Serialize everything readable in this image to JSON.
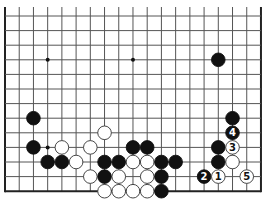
{
  "board": {
    "size": 19,
    "visible_columns": 19,
    "visible_rows": 13,
    "origin_x": 5,
    "origin_y": 16,
    "step_x": 14.22,
    "step_y": 14.6,
    "top_extends": true,
    "edges": [
      "left",
      "right",
      "bottom"
    ],
    "line_color": "#555555",
    "edge_color": "#222222",
    "star_points": [
      [
        3,
        3
      ],
      [
        9,
        3
      ],
      [
        3,
        9
      ]
    ]
  },
  "stones": [
    {
      "color": "black",
      "col": 15,
      "row": 3
    },
    {
      "color": "black",
      "col": 2,
      "row": 7
    },
    {
      "color": "black",
      "col": 16,
      "row": 7
    },
    {
      "color": "black",
      "col": 16,
      "row": 8,
      "label": "4"
    },
    {
      "color": "black",
      "col": 2,
      "row": 9
    },
    {
      "color": "black",
      "col": 9,
      "row": 9
    },
    {
      "color": "black",
      "col": 10,
      "row": 9
    },
    {
      "color": "black",
      "col": 15,
      "row": 9
    },
    {
      "color": "black",
      "col": 3,
      "row": 10
    },
    {
      "color": "black",
      "col": 4,
      "row": 10
    },
    {
      "color": "black",
      "col": 7,
      "row": 10
    },
    {
      "color": "black",
      "col": 8,
      "row": 10
    },
    {
      "color": "black",
      "col": 11,
      "row": 10
    },
    {
      "color": "black",
      "col": 12,
      "row": 10
    },
    {
      "color": "black",
      "col": 15,
      "row": 10
    },
    {
      "color": "black",
      "col": 7,
      "row": 11
    },
    {
      "color": "black",
      "col": 11,
      "row": 11
    },
    {
      "color": "black",
      "col": 14,
      "row": 11,
      "label": "2"
    },
    {
      "color": "black",
      "col": 11,
      "row": 12
    },
    {
      "color": "white",
      "col": 7,
      "row": 8
    },
    {
      "color": "white",
      "col": 4,
      "row": 9
    },
    {
      "color": "white",
      "col": 6,
      "row": 9
    },
    {
      "color": "white",
      "col": 16,
      "row": 9,
      "label": "3"
    },
    {
      "color": "white",
      "col": 5,
      "row": 10
    },
    {
      "color": "white",
      "col": 9,
      "row": 10
    },
    {
      "color": "white",
      "col": 10,
      "row": 10
    },
    {
      "color": "white",
      "col": 16,
      "row": 10
    },
    {
      "color": "white",
      "col": 6,
      "row": 11
    },
    {
      "color": "white",
      "col": 8,
      "row": 11
    },
    {
      "color": "white",
      "col": 10,
      "row": 11
    },
    {
      "color": "white",
      "col": 15,
      "row": 11,
      "label": "1"
    },
    {
      "color": "white",
      "col": 17,
      "row": 11,
      "label": "5"
    },
    {
      "color": "white",
      "col": 7,
      "row": 12
    },
    {
      "color": "white",
      "col": 8,
      "row": 12
    },
    {
      "color": "white",
      "col": 9,
      "row": 12
    },
    {
      "color": "white",
      "col": 10,
      "row": 12
    }
  ]
}
